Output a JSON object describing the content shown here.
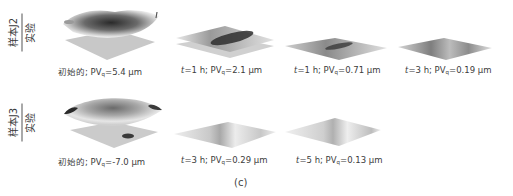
{
  "figure_label": "(c)",
  "rows": [
    {
      "label_top": "样本J2",
      "label_bottom": "实验",
      "panels": [
        {
          "prefix": "初始的; ",
          "time": "",
          "time_unit": "",
          "pv_label": "PV",
          "pv_sub": "q",
          "pv_value": "=5.4 μm",
          "surface": "initial-wavy"
        },
        {
          "prefix": "",
          "time": "t",
          "time_unit": "=1 h; ",
          "pv_label": "PV",
          "pv_sub": "q",
          "pv_value": "=2.1 μm",
          "surface": "ridge"
        },
        {
          "prefix": "",
          "time": "t",
          "time_unit": "=1 h; ",
          "pv_label": "PV",
          "pv_sub": "q",
          "pv_value": "=0.71 μm",
          "surface": "flat-ridge"
        },
        {
          "prefix": "",
          "time": "t",
          "time_unit": "=3 h; ",
          "pv_label": "PV",
          "pv_sub": "q",
          "pv_value": "=0.19 μm",
          "surface": "flat"
        }
      ]
    },
    {
      "label_top": "样本J3",
      "label_bottom": "实验",
      "panels": [
        {
          "prefix": "初始的; ",
          "time": "",
          "time_unit": "",
          "pv_label": "PV",
          "pv_sub": "q",
          "pv_value": "=-7.0 μm",
          "surface": "initial-dome"
        },
        {
          "prefix": "",
          "time": "t",
          "time_unit": "=3 h; ",
          "pv_label": "PV",
          "pv_sub": "q",
          "pv_value": "=0.29 μm",
          "surface": "flat-light"
        },
        {
          "prefix": "",
          "time": "t",
          "time_unit": "=5 h; ",
          "pv_label": "PV",
          "pv_sub": "q",
          "pv_value": "=0.13 μm",
          "surface": "flat-light"
        }
      ]
    }
  ]
}
